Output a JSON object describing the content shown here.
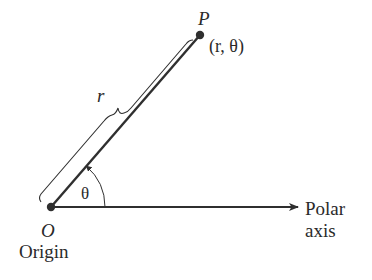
{
  "diagram": {
    "labels": {
      "point_name": "P",
      "point_coords": "(r, θ)",
      "radius": "r",
      "angle": "θ",
      "origin_letter": "O",
      "origin_word": "Origin",
      "axis_line1": "Polar",
      "axis_line2": "axis"
    },
    "geometry": {
      "origin": [
        51,
        207
      ],
      "point": [
        200,
        35
      ],
      "axis_end": [
        298,
        207
      ],
      "angle_arc_radius": 54
    },
    "colors": {
      "line": "#2f2f2f",
      "text": "#2a2a2a",
      "background": "#ffffff"
    }
  }
}
